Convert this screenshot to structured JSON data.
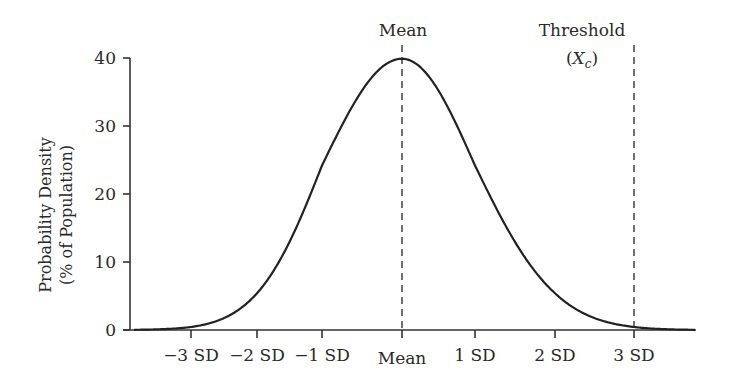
{
  "chart_data": {
    "type": "line",
    "title": "",
    "xlabel": "",
    "ylabel": "Probability Density (% of Population)",
    "ylabel_lines": [
      "Probability Density",
      "(% of Population)"
    ],
    "ylim": [
      0,
      40
    ],
    "yticks": [
      0,
      10,
      20,
      30,
      40
    ],
    "ytick_labels": [
      "0",
      "10",
      "20",
      "30",
      "40"
    ],
    "xlim_sd": [
      -3.8,
      3.8
    ],
    "xticks_sd": [
      -3,
      -2,
      -1,
      0,
      1,
      2,
      3
    ],
    "xtick_labels": [
      "−3 SD",
      "−2 SD",
      "−1 SD",
      "Mean",
      "1 SD",
      "2 SD",
      "3 SD"
    ],
    "grid": false,
    "legend": null,
    "series": [
      {
        "name": "Normal distribution",
        "x_sd": [
          -3.8,
          -3.5,
          -3,
          -2.5,
          -2,
          -1.5,
          -1,
          -0.5,
          0,
          0.5,
          1,
          1.5,
          2,
          2.5,
          3,
          3.5,
          3.8
        ],
        "y_pct": [
          0.03,
          0.09,
          0.44,
          1.75,
          5.4,
          12.95,
          24.2,
          35.21,
          39.89,
          35.21,
          24.2,
          12.95,
          5.4,
          1.75,
          0.44,
          0.09,
          0.03
        ]
      }
    ],
    "annotations": [
      {
        "label": "Mean",
        "x_sd": 0,
        "style": "dashed-vertical"
      },
      {
        "label": "Threshold",
        "sublabel": "(X",
        "sublabel_sub": "c",
        "sublabel_end": ")",
        "x_sd": 3,
        "style": "dashed-vertical"
      }
    ]
  },
  "labels": {
    "mean_top": "Mean",
    "threshold_title": "Threshold",
    "threshold_open": "(",
    "threshold_var": "X",
    "threshold_sub": "c",
    "threshold_close": ")",
    "ylabel_line1": "Probability Density",
    "ylabel_line2": "(% of Population)"
  }
}
